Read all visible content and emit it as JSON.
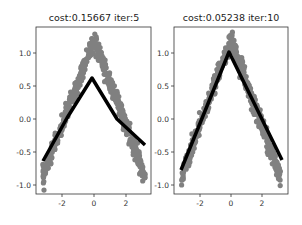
{
  "chart_data": [
    {
      "type": "scatter",
      "title": "cost:0.15667  iter:5",
      "xlabel": "",
      "ylabel": "",
      "xlim": [
        -3.6,
        3.6
      ],
      "ylim": [
        -1.15,
        1.4
      ],
      "xticks": [
        "-2",
        "0",
        "2"
      ],
      "yticks": [
        "-1.0",
        "-0.5",
        "0.0",
        "0.5",
        "1.0"
      ],
      "grid": false,
      "series": [
        {
          "name": "data",
          "style": "scatter",
          "color": "#808080",
          "description": "noisy |x| shaped data: y = 1.2 - 0.65*|x| + noise"
        },
        {
          "name": "prediction",
          "style": "line",
          "color": "#000000",
          "x": [
            -3.2,
            -1.5,
            -0.1,
            1.5,
            3.2
          ],
          "y": [
            -0.64,
            0.03,
            0.62,
            0.0,
            -0.4
          ]
        }
      ]
    },
    {
      "type": "scatter",
      "title": "cost:0.05238  iter:10",
      "xlabel": "",
      "ylabel": "",
      "xlim": [
        -3.6,
        3.6
      ],
      "ylim": [
        -1.15,
        1.4
      ],
      "xticks": [
        "-2",
        "0",
        "2"
      ],
      "yticks": [
        "-1.0",
        "-0.5",
        "0.0",
        "0.5",
        "1.0"
      ],
      "grid": false,
      "series": [
        {
          "name": "data",
          "style": "scatter",
          "color": "#808080",
          "description": "noisy |x| shaped data: y = 1.2 - 0.65*|x| + noise"
        },
        {
          "name": "prediction",
          "style": "line",
          "color": "#000000",
          "x": [
            -3.2,
            -0.1,
            3.2
          ],
          "y": [
            -0.77,
            1.03,
            -0.63
          ]
        }
      ]
    }
  ],
  "plots": {
    "left": {
      "title": "cost:0.15667  iter:5"
    },
    "right": {
      "title": "cost:0.05238  iter:10"
    }
  },
  "ticks": {
    "x": [
      "-2",
      "0",
      "2"
    ],
    "y": [
      "1.0",
      "0.5",
      "0.0",
      "-0.5",
      "-1.0"
    ]
  }
}
